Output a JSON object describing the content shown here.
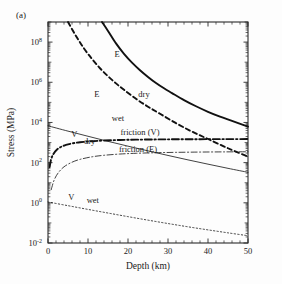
{
  "figure": {
    "panel_label": "(a)",
    "background_color": "#fdfdfd"
  },
  "chart_data": {
    "type": "line",
    "title": "",
    "xlabel": "Depth (km)",
    "ylabel": "Stress (MPa)",
    "xlim": [
      0,
      50
    ],
    "ylim": [
      0.01,
      1000000000
    ],
    "yscale": "log",
    "xscale": "linear",
    "grid": false,
    "legend_position": "inline-annotations",
    "xticks": [
      0,
      10,
      20,
      30,
      40,
      50
    ],
    "xticklabels": [
      "0",
      "10",
      "20",
      "30",
      "40",
      "50"
    ],
    "yticks": [
      0.01,
      1,
      100,
      10000,
      1000000,
      100000000
    ],
    "yticklabels": [
      "10-2",
      "100",
      "102",
      "104",
      "106",
      "108"
    ],
    "ytick_mantissa": [
      "10",
      "10",
      "10",
      "10",
      "10",
      "10"
    ],
    "ytick_exponent": [
      "-2",
      "0",
      "2",
      "4",
      "6",
      "8"
    ],
    "series": [
      {
        "name": "E dry",
        "style": "solid-thick",
        "label_main": "E",
        "label_sub": "dry",
        "label_main_pos": [
          17.3,
          18000000.0
        ],
        "label_sub_pos": [
          24.0,
          180000.0
        ],
        "x": [
          13.5,
          15,
          17,
          19,
          21,
          23,
          25,
          27,
          29,
          31,
          34,
          37,
          40,
          43,
          46,
          50
        ],
        "y": [
          1000000000,
          360000000,
          86000000,
          26000000,
          9500000,
          4000000,
          1850000,
          920000,
          500000,
          290000,
          130000,
          64000,
          34000,
          19500,
          12000,
          6200
        ]
      },
      {
        "name": "E wet",
        "style": "dashed-thick",
        "label_main": "E",
        "label_sub": "wet",
        "label_main_pos": [
          12.2,
          180000.0
        ],
        "label_sub_pos": [
          17.5,
          12000.0
        ],
        "x": [
          5.0,
          7,
          9,
          11,
          13,
          15,
          17,
          19,
          22,
          25,
          28,
          32,
          36,
          40,
          45,
          50
        ],
        "y": [
          1000000000,
          200000000,
          48000000,
          14500000,
          5000000,
          2000000,
          880000,
          420000,
          150000,
          61000,
          27000,
          9200,
          3500,
          1500,
          520,
          200
        ]
      },
      {
        "name": "friction (V)",
        "style": "dashdot-thick",
        "label_main": "friction (V)",
        "label_sub": "",
        "label_main_pos": [
          23.0,
          2500.0
        ],
        "label_sub_pos": null,
        "x": [
          0.4,
          0.8,
          1.4,
          2.2,
          3.2,
          4.5,
          6,
          8,
          11,
          14,
          18,
          22,
          27,
          32,
          38,
          44,
          50
        ],
        "y": [
          60,
          150,
          280,
          440,
          600,
          760,
          900,
          1030,
          1170,
          1260,
          1340,
          1390,
          1430,
          1450,
          1470,
          1480,
          1490
        ]
      },
      {
        "name": "friction (E)",
        "style": "dashdot-thin",
        "label_main": "friction (E)",
        "label_sub": "",
        "label_main_pos": [
          22.5,
          330.0
        ],
        "label_sub_pos": null,
        "x": [
          0.8,
          1.5,
          2.5,
          4,
          6,
          8,
          11,
          14,
          18,
          22,
          27,
          32,
          38,
          44,
          50
        ],
        "y": [
          4.5,
          13,
          30,
          62,
          105,
          145,
          195,
          232,
          268,
          292,
          312,
          325,
          336,
          343,
          348
        ]
      },
      {
        "name": "V dry",
        "style": "solid-thin",
        "label_main": "V",
        "label_sub": "dry",
        "label_main_pos": [
          6.6,
          1900.0
        ],
        "label_sub_pos": [
          10.4,
          800.0
        ],
        "x": [
          0,
          5,
          10,
          15,
          20,
          25,
          30,
          35,
          40,
          45,
          50
        ],
        "y": [
          6800,
          3700,
          2050,
          1150,
          660,
          385,
          228,
          137,
          84,
          52,
          33
        ]
      },
      {
        "name": "V wet",
        "style": "dotted-thin",
        "label_main": "V",
        "label_sub": "wet",
        "label_main_pos": [
          5.8,
          1.35
        ],
        "label_sub_pos": [
          11.2,
          0.95
        ],
        "x": [
          0,
          5,
          10,
          15,
          20,
          25,
          30,
          35,
          40,
          45,
          50
        ],
        "y": [
          1.1,
          0.72,
          0.47,
          0.31,
          0.205,
          0.137,
          0.093,
          0.064,
          0.045,
          0.032,
          0.023
        ]
      }
    ],
    "annotations": [
      {
        "text": "E",
        "kind": "curve-label"
      },
      {
        "text": "dry",
        "kind": "curve-label"
      },
      {
        "text": "E",
        "kind": "curve-label"
      },
      {
        "text": "wet",
        "kind": "curve-label"
      },
      {
        "text": "friction (V)",
        "kind": "curve-label"
      },
      {
        "text": "friction (E)",
        "kind": "curve-label"
      },
      {
        "text": "V",
        "kind": "curve-label"
      },
      {
        "text": "dry",
        "kind": "curve-label"
      },
      {
        "text": "V",
        "kind": "curve-label"
      },
      {
        "text": "wet",
        "kind": "curve-label"
      }
    ]
  }
}
